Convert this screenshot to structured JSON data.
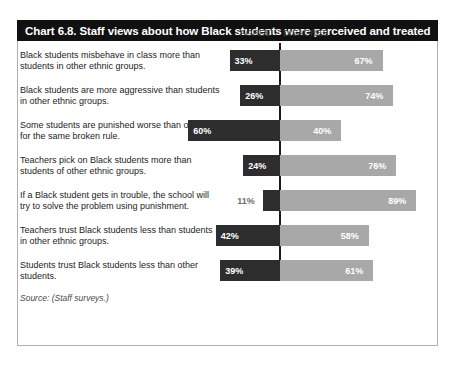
{
  "chart": {
    "title": "Chart 6.8. Staff views about how Black students were perceived and treated",
    "source": "Source: (Staff surveys.)",
    "headers": {
      "agree": "AGREE",
      "disagree": "DISAGREE"
    }
  },
  "chart_data": {
    "type": "bar",
    "subtype": "diverging-stacked-bar",
    "title": "Chart 6.8. Staff views about how Black students were perceived and treated",
    "xlabel": "",
    "ylabel": "",
    "xlim": [
      0,
      100
    ],
    "grid": false,
    "legend_position": "top",
    "units": "percent",
    "source": "Source: (Staff surveys.)",
    "categories": [
      "Black students misbehave in class more than students in other ethnic groups.",
      "Black students are more aggressive than students in other ethnic groups.",
      "Some students are punished worse than others for the same broken rule.",
      "Teachers pick on Black students more than students of other ethnic groups.",
      "If a Black student gets in trouble, the school will try to solve the problem using punishment.",
      "Teachers trust Black students less than students in other ethnic groups.",
      "Students trust Black students less than other students."
    ],
    "series": [
      {
        "name": "AGREE",
        "color": "#2d2d2d",
        "values": [
          33,
          26,
          60,
          24,
          11,
          42,
          39
        ],
        "labels": [
          "33%",
          "26%",
          "60%",
          "24%",
          "11%",
          "42%",
          "39%"
        ]
      },
      {
        "name": "DISAGREE",
        "color": "#a8a8a8",
        "values": [
          67,
          74,
          40,
          76,
          89,
          58,
          61
        ],
        "labels": [
          "67%",
          "74%",
          "40%",
          "76%",
          "89%",
          "58%",
          "61%"
        ]
      }
    ]
  },
  "rows": [
    {
      "label": "Black students misbehave in class more than students in other ethnic groups.",
      "agree": 33,
      "agree_label": "33%",
      "disagree": 67,
      "disagree_label": "67%"
    },
    {
      "label": "Black students are more aggressive than students in other ethnic groups.",
      "agree": 26,
      "agree_label": "26%",
      "disagree": 74,
      "disagree_label": "74%"
    },
    {
      "label": "Some students are punished worse than others for the same broken rule.",
      "agree": 60,
      "agree_label": "60%",
      "disagree": 40,
      "disagree_label": "40%"
    },
    {
      "label": "Teachers pick on Black students more than students of other ethnic groups.",
      "agree": 24,
      "agree_label": "24%",
      "disagree": 76,
      "disagree_label": "76%"
    },
    {
      "label": "If a Black student gets in trouble, the school will try to solve the problem using punishment.",
      "agree": 11,
      "agree_label": "11%",
      "disagree": 89,
      "disagree_label": "89%"
    },
    {
      "label": "Teachers trust Black students less than students in other ethnic groups.",
      "agree": 42,
      "agree_label": "42%",
      "disagree": 58,
      "disagree_label": "58%"
    },
    {
      "label": "Students trust Black students less than other students.",
      "agree": 39,
      "agree_label": "39%",
      "disagree": 61,
      "disagree_label": "61%"
    }
  ]
}
